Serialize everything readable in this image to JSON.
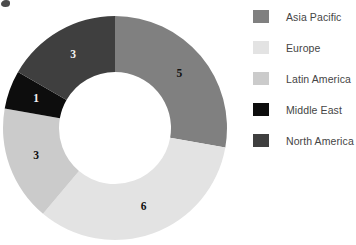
{
  "chart_data": {
    "type": "pie",
    "variant": "donut",
    "title": "",
    "subtitle": "",
    "xlabel": "",
    "ylabel": "",
    "total": 18,
    "labels_shown": "values",
    "legend_position": "right",
    "grid": false,
    "categories": [
      "Asia Pacific",
      "Europe",
      "Latin America",
      "Middle East",
      "North America"
    ],
    "values": [
      5,
      6,
      3,
      1,
      3
    ],
    "colors": [
      "#808080",
      "#e3e3e3",
      "#cbcbcb",
      "#0d0d0d",
      "#3f3f3f"
    ],
    "slices": [
      {
        "label": "Asia Pacific",
        "value": 5,
        "value_text": "5",
        "color": "#808080",
        "start_angle": 0,
        "end_angle": 100,
        "label_on_dark": false
      },
      {
        "label": "Europe",
        "value": 6,
        "value_text": "6",
        "color": "#e3e3e3",
        "start_angle": 100,
        "end_angle": 220,
        "label_on_dark": false
      },
      {
        "label": "Latin America",
        "value": 3,
        "value_text": "3",
        "color": "#cbcbcb",
        "start_angle": 220,
        "end_angle": 280,
        "label_on_dark": false
      },
      {
        "label": "Middle East",
        "value": 1,
        "value_text": "1",
        "color": "#0d0d0d",
        "start_angle": 280,
        "end_angle": 300,
        "label_on_dark": true
      },
      {
        "label": "North America",
        "value": 3,
        "value_text": "3",
        "color": "#3f3f3f",
        "start_angle": 300,
        "end_angle": 360,
        "label_on_dark": true
      }
    ],
    "geometry": {
      "center_x": 115,
      "center_y": 128,
      "outer_radius": 112,
      "inner_radius": 56,
      "label_radius": 84
    }
  },
  "legend": {
    "items": [
      {
        "label": "Asia Pacific",
        "color": "#808080"
      },
      {
        "label": "Europe",
        "color": "#e3e3e3"
      },
      {
        "label": "Latin America",
        "color": "#cbcbcb"
      },
      {
        "label": "Middle East",
        "color": "#0d0d0d"
      },
      {
        "label": "North America",
        "color": "#3f3f3f"
      }
    ]
  }
}
